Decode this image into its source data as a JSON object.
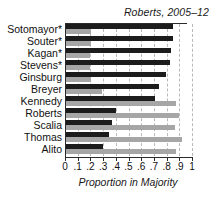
{
  "chart_data": {
    "type": "bar",
    "orientation": "horizontal",
    "title": "Roberts, 2005–12",
    "xlabel": "Proportion in Majority",
    "ylabel": "",
    "xlim": [
      0,
      1
    ],
    "grid": true,
    "legend_position": "none",
    "tick_labels": [
      "0",
      ".1",
      ".2",
      ".3",
      ".4",
      ".5",
      ".6",
      ".7",
      ".8",
      ".9",
      "1"
    ],
    "tick_values": [
      0,
      0.1,
      0.2,
      0.3,
      0.4,
      0.5,
      0.6,
      0.7,
      0.8,
      0.9,
      1
    ],
    "categories": [
      "Sotomayor*",
      "Souter*",
      "Kagan*",
      "Stevens*",
      "Ginsburg",
      "Breyer",
      "Kennedy",
      "Roberts",
      "Scalia",
      "Thomas",
      "Alito"
    ],
    "series": [
      {
        "name": "dark",
        "color": "#1c1c1c",
        "values": [
          0.84,
          0.84,
          0.83,
          0.82,
          0.79,
          0.73,
          0.7,
          0.39,
          0.36,
          0.34,
          0.29
        ]
      },
      {
        "name": "light",
        "color": "#a6a6a6",
        "values": [
          0.2,
          0.2,
          0.19,
          0.19,
          0.2,
          0.28,
          0.87,
          0.89,
          0.86,
          0.91,
          0.87
        ]
      }
    ]
  }
}
